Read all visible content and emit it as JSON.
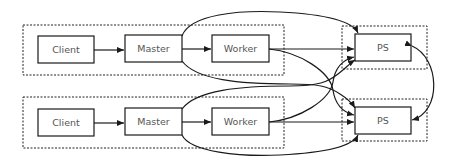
{
  "diagram": {
    "rows": [
      {
        "id": "row-1",
        "nodes": [
          {
            "id": "client-1",
            "label": "Client"
          },
          {
            "id": "master-1",
            "label": "Master"
          },
          {
            "id": "worker-1",
            "label": "Worker"
          },
          {
            "id": "ps-1",
            "label": "PS"
          }
        ]
      },
      {
        "id": "row-2",
        "nodes": [
          {
            "id": "client-2",
            "label": "Client"
          },
          {
            "id": "master-2",
            "label": "Master"
          },
          {
            "id": "worker-2",
            "label": "Worker"
          },
          {
            "id": "ps-2",
            "label": "PS"
          }
        ]
      }
    ],
    "edges": [
      {
        "from": "client-1",
        "to": "master-1"
      },
      {
        "from": "master-1",
        "to": "worker-1"
      },
      {
        "from": "worker-1",
        "to": "ps-1"
      },
      {
        "from": "worker-1",
        "to": "ps-2"
      },
      {
        "from": "master-1",
        "to": "ps-1"
      },
      {
        "from": "master-1",
        "to": "ps-2"
      },
      {
        "from": "client-2",
        "to": "master-2"
      },
      {
        "from": "master-2",
        "to": "worker-2"
      },
      {
        "from": "worker-2",
        "to": "ps-2"
      },
      {
        "from": "worker-2",
        "to": "ps-1"
      },
      {
        "from": "master-2",
        "to": "ps-2"
      },
      {
        "from": "master-2",
        "to": "ps-1"
      },
      {
        "from": "ps-1",
        "to": "ps-2",
        "bidirectional": true
      }
    ],
    "colors": {
      "stroke": "#1a1a1a",
      "text": "#555555",
      "background": "#ffffff"
    }
  }
}
